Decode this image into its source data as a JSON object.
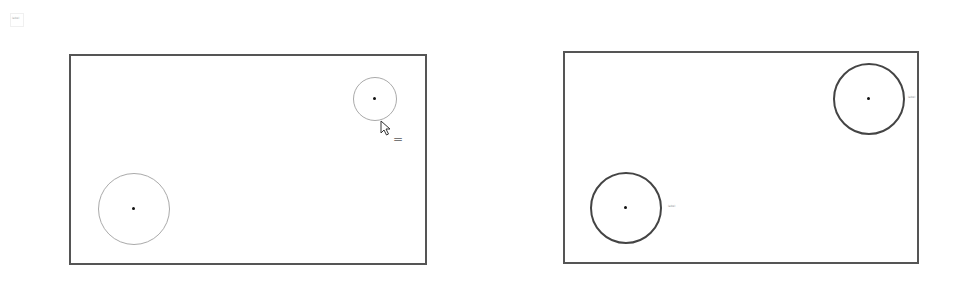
{
  "thumbnail": {
    "icon": "document-thumbnail-icon",
    "text": "label"
  },
  "panels": [
    {
      "name": "left-panel",
      "rect": {
        "x": 69,
        "y": 54,
        "w": 358,
        "h": 211
      },
      "circles": [
        {
          "name": "small-circle",
          "cx": 375,
          "cy": 99,
          "r": 22,
          "stroke": "#aaaaaa",
          "width": 1.5,
          "label": ""
        },
        {
          "name": "large-circle",
          "cx": 134,
          "cy": 209,
          "r": 36,
          "stroke": "#aaaaaa",
          "width": 1.5,
          "label": ""
        }
      ],
      "cursor": {
        "x": 380,
        "y": 121
      },
      "equals_glyph": "="
    },
    {
      "name": "right-panel",
      "rect": {
        "x": 563,
        "y": 51,
        "w": 356,
        "h": 213
      },
      "circles": [
        {
          "name": "top-right-circle",
          "cx": 869,
          "cy": 99,
          "r": 36,
          "stroke": "#444444",
          "width": 2,
          "label": "label"
        },
        {
          "name": "bottom-left-circle",
          "cx": 626,
          "cy": 208,
          "r": 36,
          "stroke": "#444444",
          "width": 2,
          "label": "label"
        }
      ]
    }
  ],
  "colors": {
    "panel_border": "#555555",
    "dot": "#111111"
  }
}
